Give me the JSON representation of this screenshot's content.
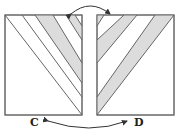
{
  "diagram": {
    "labels": {
      "left": "C",
      "right": "D"
    },
    "colors": {
      "stroke": "#666666",
      "stripe_fill": "#dcdcdc",
      "background": "#ffffff",
      "arrow": "#333333",
      "label": "#222222"
    },
    "panels": [
      {
        "id": "C",
        "stripe_direction": "down-right",
        "stripe_count": 2
      },
      {
        "id": "D",
        "stripe_direction": "up-right",
        "stripe_count": 3,
        "mirrors": "C"
      }
    ],
    "arrows": [
      {
        "from": "C-top-right",
        "to": "D-top-left",
        "style": "curved-double-headed"
      },
      {
        "from": "C",
        "to": "D",
        "style": "curved-double-headed",
        "position": "bottom"
      }
    ]
  }
}
